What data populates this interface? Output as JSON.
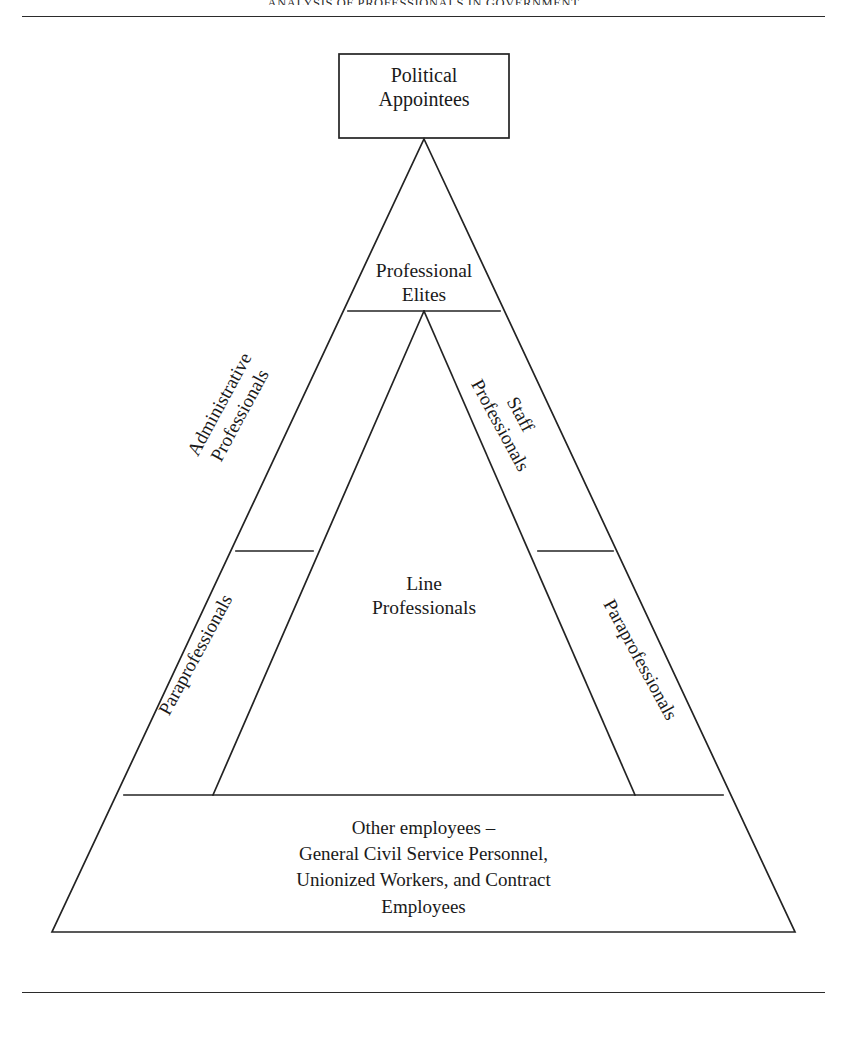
{
  "page": {
    "running_head": "ANALYSIS OF PROFESSIONALS IN GOVERNMENT",
    "background_color": "#ffffff",
    "ink_color": "#1a1a1a",
    "stroke_color": "#232323"
  },
  "figure": {
    "type": "pyramid-hierarchy",
    "apex_box": {
      "label": "Political\nAppointees"
    },
    "tiers": [
      {
        "id": "professional-elites",
        "label": "Professional\nElites",
        "position": "upper-center"
      },
      {
        "id": "administrative-professionals",
        "label": "Administrative\nProfessionals",
        "position": "upper-left-slope",
        "orientation": "rotated"
      },
      {
        "id": "staff-professionals",
        "label": "Staff\nProfessionals",
        "position": "upper-right-slope",
        "orientation": "rotated"
      },
      {
        "id": "paraprofessionals-left",
        "label": "Paraprofessionals",
        "position": "lower-left-slope",
        "orientation": "rotated"
      },
      {
        "id": "paraprofessionals-right",
        "label": "Paraprofessionals",
        "position": "lower-right-slope",
        "orientation": "rotated"
      },
      {
        "id": "line-professionals",
        "label": "Line\nProfessionals",
        "position": "center"
      },
      {
        "id": "other-employees",
        "label": "Other employees –\nGeneral Civil Service Personnel,\nUnionized Workers, and Contract\nEmployees",
        "position": "base"
      }
    ]
  }
}
